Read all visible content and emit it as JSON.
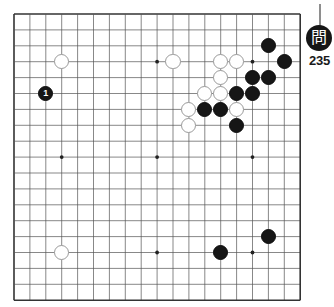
{
  "board": {
    "name": "go-board",
    "size": 19,
    "origin_x": 13,
    "origin_y": 13,
    "spacing": 15.9,
    "line_color": "#555555",
    "border_color": "#333333",
    "background_color": "#ffffff",
    "star_points": [
      {
        "col": 3,
        "row": 3
      },
      {
        "col": 9,
        "row": 3
      },
      {
        "col": 15,
        "row": 3
      },
      {
        "col": 3,
        "row": 9
      },
      {
        "col": 9,
        "row": 9
      },
      {
        "col": 15,
        "row": 9
      },
      {
        "col": 3,
        "row": 15
      },
      {
        "col": 9,
        "row": 15
      },
      {
        "col": 15,
        "row": 15
      }
    ]
  },
  "stones": [
    {
      "name": "white-stone-d16",
      "color": "white",
      "col": 3,
      "row": 3,
      "label": ""
    },
    {
      "name": "white-stone-d4",
      "color": "white",
      "col": 3,
      "row": 15,
      "label": ""
    },
    {
      "name": "white-stone-l16",
      "color": "white",
      "col": 10,
      "row": 3,
      "label": ""
    },
    {
      "name": "white-stone-p16",
      "color": "white",
      "col": 13,
      "row": 3,
      "label": ""
    },
    {
      "name": "white-stone-q16",
      "color": "white",
      "col": 14,
      "row": 3,
      "label": ""
    },
    {
      "name": "white-stone-p15",
      "color": "white",
      "col": 13,
      "row": 4,
      "label": ""
    },
    {
      "name": "white-stone-n14",
      "color": "white",
      "col": 12,
      "row": 5,
      "label": ""
    },
    {
      "name": "white-stone-p14",
      "color": "white",
      "col": 13,
      "row": 5,
      "label": ""
    },
    {
      "name": "white-stone-m13",
      "color": "white",
      "col": 11,
      "row": 6,
      "label": ""
    },
    {
      "name": "white-stone-q13",
      "color": "white",
      "col": 14,
      "row": 6,
      "label": ""
    },
    {
      "name": "white-stone-m12",
      "color": "white",
      "col": 11,
      "row": 7,
      "label": ""
    },
    {
      "name": "black-stone-move-1",
      "color": "black",
      "col": 2,
      "row": 5,
      "label": "1"
    },
    {
      "name": "black-stone-s17",
      "color": "black",
      "col": 16,
      "row": 2,
      "label": ""
    },
    {
      "name": "black-stone-t16",
      "color": "black",
      "col": 17,
      "row": 3,
      "label": ""
    },
    {
      "name": "black-stone-r15",
      "color": "black",
      "col": 15,
      "row": 4,
      "label": ""
    },
    {
      "name": "black-stone-s15",
      "color": "black",
      "col": 16,
      "row": 4,
      "label": ""
    },
    {
      "name": "black-stone-q14",
      "color": "black",
      "col": 14,
      "row": 5,
      "label": ""
    },
    {
      "name": "black-stone-r14",
      "color": "black",
      "col": 15,
      "row": 5,
      "label": ""
    },
    {
      "name": "black-stone-n13",
      "color": "black",
      "col": 12,
      "row": 6,
      "label": ""
    },
    {
      "name": "black-stone-p13",
      "color": "black",
      "col": 13,
      "row": 6,
      "label": ""
    },
    {
      "name": "black-stone-q12",
      "color": "black",
      "col": 14,
      "row": 7,
      "label": ""
    },
    {
      "name": "black-stone-p4",
      "color": "black",
      "col": 13,
      "row": 15,
      "label": ""
    },
    {
      "name": "black-stone-s5",
      "color": "black",
      "col": 16,
      "row": 14,
      "label": ""
    }
  ],
  "marker": {
    "kanji": "問",
    "number": "235",
    "stem_color": "#8e8e8e",
    "badge_color": "#161616"
  }
}
